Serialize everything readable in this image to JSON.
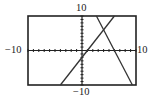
{
  "chart_data": {
    "type": "line",
    "title": "",
    "xlabel": "",
    "ylabel": "",
    "xlim": [
      -10,
      10
    ],
    "ylim": [
      -10,
      10
    ],
    "grid": false,
    "tick_labels": {
      "xmin": "−10",
      "xmax": "10",
      "ymin": "−10",
      "ymax": "10"
    },
    "tick_step": 1,
    "series": [
      {
        "name": "ascending line",
        "equation": "y = 2x - 2",
        "x": [
          -4,
          6
        ],
        "y": [
          -10,
          10
        ]
      },
      {
        "name": "descending line",
        "equation": "y = -3x + 18",
        "x": [
          2.67,
          9.33
        ],
        "y": [
          10,
          -10
        ]
      }
    ],
    "intersection": {
      "x": 4,
      "y": 6
    },
    "colors": {
      "line": "#333333",
      "axis": "#222222",
      "frame": "#222222"
    }
  },
  "labels": {
    "top": "10",
    "bottom": "−10",
    "left": "−10",
    "right": "10"
  }
}
